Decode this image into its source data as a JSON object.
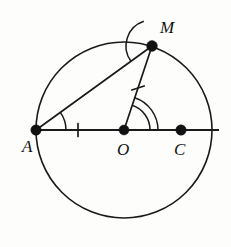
{
  "figure": {
    "background_color": "#fdfdfc",
    "stroke_color": "#1a1a1a",
    "label_color": "#111111"
  },
  "circle": {
    "name": "main-circle",
    "center_x": 124,
    "center_y": 130,
    "radius": 88,
    "stroke_width": 1.6
  },
  "points": [
    {
      "id": "A",
      "label": "A",
      "x": 36,
      "y": 130,
      "label_x": 22,
      "label_y": 152,
      "dot_radius": 5.2,
      "on_circle": true
    },
    {
      "id": "M",
      "label": "M",
      "x": 152,
      "y": 46,
      "label_x": 160,
      "label_y": 33,
      "dot_radius": 5.4,
      "on_circle": true
    },
    {
      "id": "O",
      "label": "O",
      "x": 124,
      "y": 130,
      "label_x": 117,
      "label_y": 155,
      "dot_radius": 5.0,
      "on_circle": false
    },
    {
      "id": "C",
      "label": "C",
      "x": 181,
      "y": 130,
      "label_x": 174,
      "label_y": 155,
      "dot_radius": 5.2,
      "on_circle": false
    }
  ],
  "segments": [
    {
      "id": "AM",
      "name": "chord-a-m",
      "from": "A",
      "to": "M",
      "x1": 36,
      "y1": 130,
      "x2": 152,
      "y2": 46,
      "stroke_width": 1.7
    },
    {
      "id": "OM",
      "name": "radius-o-m",
      "from": "O",
      "to": "M",
      "x1": 124,
      "y1": 130,
      "x2": 152,
      "y2": 46,
      "stroke_width": 1.7
    },
    {
      "id": "diameter-line",
      "name": "horizontal-line",
      "from": "A",
      "to": "right-edge",
      "x1": 36,
      "y1": 130,
      "x2": 219,
      "y2": 130,
      "stroke_width": 1.8
    }
  ],
  "tick_marks": [
    {
      "id": "tick-AO",
      "name": "congruence-tick-segment-ao",
      "cx": 78,
      "cy": 130,
      "angle_deg": 0,
      "length": 13,
      "count": 1
    },
    {
      "id": "tick-OM",
      "name": "congruence-tick-segment-om",
      "cx": 138,
      "cy": 88,
      "angle_deg": 71.6,
      "length": 13,
      "count": 1
    }
  ],
  "angle_arcs": [
    {
      "id": "angle-A",
      "name": "angle-arc-at-a",
      "vertex": "A",
      "vx": 36,
      "vy": 130,
      "radius": 30,
      "start_deg": -35.9,
      "end_deg": 0,
      "arcs": 1
    },
    {
      "id": "angle-M",
      "name": "angle-arc-at-m",
      "vertex": "M",
      "vx": 152,
      "vy": 46,
      "radius": 26,
      "start_deg": 144.1,
      "end_deg": 251.6,
      "arcs": 1
    },
    {
      "id": "angle-O",
      "name": "angle-arc-at-o",
      "vertex": "O",
      "vx": 124,
      "vy": 130,
      "radius": 26,
      "radius2": 34,
      "start_deg": -71.6,
      "end_deg": 0,
      "arcs": 2
    }
  ],
  "labels": {
    "point_a": "A",
    "point_m": "M",
    "point_o": "O",
    "point_c": "C"
  }
}
